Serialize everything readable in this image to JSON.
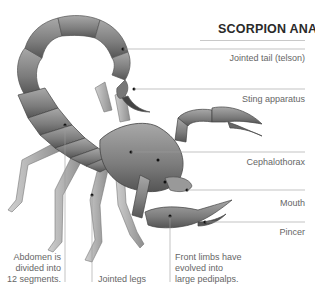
{
  "title": "SCORPION ANATOMY",
  "labels_right": [
    {
      "text": "Jointed tail (telson)",
      "y": 53
    },
    {
      "text": "Sting apparatus",
      "y": 94
    },
    {
      "text": "Cephalothorax",
      "y": 157
    },
    {
      "text": "Mouth",
      "y": 198
    },
    {
      "text": "Pincer",
      "y": 226
    }
  ],
  "labels_bottom": [
    {
      "text": "Abdomen is divided into 12 segments.",
      "lines": [
        "Abdomen is",
        "divided into",
        "12 segments."
      ]
    },
    {
      "text": "Jointed legs",
      "lines": [
        "Jointed legs"
      ]
    },
    {
      "text": "Front limbs have evolved into large pedipalps.",
      "lines": [
        "Front limbs have",
        "evolved into",
        "large pedipalps."
      ]
    }
  ],
  "colors": {
    "body": "#8a8a8a",
    "body_dark": "#5e5e5e",
    "body_light": "#b5b5b5",
    "leader_line": "#c9c9c9",
    "title": "#2a2a2a",
    "text": "#666666"
  }
}
